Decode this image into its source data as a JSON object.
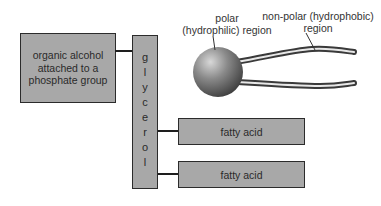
{
  "diagram": {
    "left_box": {
      "label": "organic alcohol attached to a phosphate group"
    },
    "glycerol": {
      "label": "glycerol",
      "letters": [
        "g",
        "l",
        "y",
        "c",
        "e",
        "r",
        "o",
        "l"
      ]
    },
    "fatty_acids": [
      {
        "label": "fatty acid"
      },
      {
        "label": "fatty acid"
      }
    ],
    "polar_label": {
      "line1": "polar",
      "line2": "(hydrophilic) region"
    },
    "nonpolar_label": {
      "line1": "non-polar (hydrophobic)",
      "line2": "region"
    },
    "colors": {
      "box_fill": "#a8a8a8",
      "border": "#2b2b2b",
      "sphere": "#7a7a7a"
    }
  }
}
